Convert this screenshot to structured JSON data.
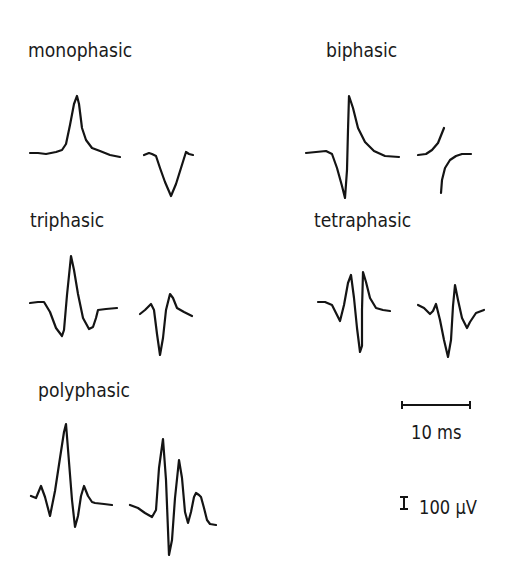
{
  "figure": {
    "labels": {
      "monophasic": "monophasic",
      "biphasic": "biphasic",
      "triphasic": "triphasic",
      "tetraphasic": "tetraphasic",
      "polyphasic": "polyphasic"
    },
    "scale_bars": {
      "time": "10 ms",
      "amplitude": "100 µV"
    },
    "colors": {
      "trace": "#141414",
      "background": "#ffffff"
    },
    "waveforms": [
      {
        "group": "monophasic",
        "index": 1,
        "points": [
          [
            30,
            153
          ],
          [
            38,
            153
          ],
          [
            46,
            154
          ],
          [
            56,
            152
          ],
          [
            62,
            150
          ],
          [
            66,
            144
          ],
          [
            70,
            125
          ],
          [
            74,
            104
          ],
          [
            77,
            96
          ],
          [
            79,
            104
          ],
          [
            82,
            128
          ],
          [
            86,
            140
          ],
          [
            92,
            148
          ],
          [
            100,
            151
          ],
          [
            110,
            155
          ],
          [
            120,
            157
          ]
        ]
      },
      {
        "group": "monophasic",
        "index": 2,
        "points": [
          [
            144,
            155
          ],
          [
            149,
            153
          ],
          [
            152,
            154
          ],
          [
            156,
            156
          ],
          [
            160,
            168
          ],
          [
            165,
            182
          ],
          [
            171,
            196
          ],
          [
            176,
            184
          ],
          [
            181,
            168
          ],
          [
            186,
            152
          ],
          [
            189,
            154
          ],
          [
            193,
            155
          ]
        ]
      },
      {
        "group": "biphasic",
        "index": 1,
        "points": [
          [
            306,
            153
          ],
          [
            316,
            152
          ],
          [
            326,
            151
          ],
          [
            332,
            154
          ],
          [
            337,
            168
          ],
          [
            342,
            186
          ],
          [
            345,
            198
          ],
          [
            347,
            170
          ],
          [
            348,
            130
          ],
          [
            349,
            96
          ],
          [
            353,
            108
          ],
          [
            358,
            128
          ],
          [
            365,
            142
          ],
          [
            374,
            151
          ],
          [
            385,
            156
          ],
          [
            399,
            157
          ]
        ]
      },
      {
        "group": "biphasic",
        "index": 2,
        "points": [
          [
            418,
            155
          ],
          [
            426,
            154
          ],
          [
            432,
            150
          ],
          [
            438,
            143
          ],
          [
            442,
            133
          ],
          [
            444,
            128
          ]
        ]
      },
      {
        "group": "biphasic",
        "index": 3,
        "points": [
          [
            441,
            193
          ],
          [
            442,
            180
          ],
          [
            445,
            168
          ],
          [
            450,
            160
          ],
          [
            456,
            156
          ],
          [
            462,
            154
          ],
          [
            471,
            154
          ]
        ]
      },
      {
        "group": "triphasic",
        "index": 1,
        "points": [
          [
            30,
            303
          ],
          [
            38,
            302
          ],
          [
            44,
            302
          ],
          [
            50,
            312
          ],
          [
            56,
            328
          ],
          [
            62,
            336
          ],
          [
            64,
            330
          ],
          [
            67,
            295
          ],
          [
            71,
            256
          ],
          [
            74,
            270
          ],
          [
            78,
            294
          ],
          [
            83,
            318
          ],
          [
            89,
            329
          ],
          [
            93,
            327
          ],
          [
            96,
            318
          ],
          [
            98,
            310
          ],
          [
            106,
            309
          ],
          [
            117,
            308
          ]
        ]
      },
      {
        "group": "triphasic",
        "index": 2,
        "points": [
          [
            140,
            314
          ],
          [
            145,
            310
          ],
          [
            151,
            304
          ],
          [
            154,
            310
          ],
          [
            157,
            334
          ],
          [
            160,
            355
          ],
          [
            163,
            338
          ],
          [
            166,
            310
          ],
          [
            170,
            294
          ],
          [
            173,
            298
          ],
          [
            177,
            308
          ],
          [
            184,
            312
          ],
          [
            192,
            316
          ]
        ]
      },
      {
        "group": "tetraphasic",
        "index": 1,
        "points": [
          [
            318,
            302
          ],
          [
            325,
            302
          ],
          [
            332,
            305
          ],
          [
            336,
            313
          ],
          [
            340,
            321
          ],
          [
            344,
            305
          ],
          [
            348,
            283
          ],
          [
            351,
            275
          ],
          [
            354,
            298
          ],
          [
            357,
            328
          ],
          [
            360,
            352
          ],
          [
            362,
            346
          ],
          [
            362,
            310
          ],
          [
            363,
            272
          ],
          [
            366,
            282
          ],
          [
            370,
            298
          ],
          [
            376,
            308
          ],
          [
            383,
            310
          ],
          [
            390,
            311
          ]
        ]
      },
      {
        "group": "tetraphasic",
        "index": 2,
        "points": [
          [
            418,
            305
          ],
          [
            424,
            308
          ],
          [
            430,
            314
          ],
          [
            433,
            311
          ],
          [
            436,
            304
          ],
          [
            440,
            320
          ],
          [
            444,
            340
          ],
          [
            448,
            357
          ],
          [
            451,
            340
          ],
          [
            453,
            306
          ],
          [
            455,
            285
          ],
          [
            458,
            300
          ],
          [
            462,
            318
          ],
          [
            467,
            328
          ],
          [
            470,
            322
          ],
          [
            476,
            313
          ],
          [
            484,
            310
          ]
        ]
      },
      {
        "group": "polyphasic",
        "index": 1,
        "points": [
          [
            31,
            496
          ],
          [
            36,
            498
          ],
          [
            41,
            486
          ],
          [
            45,
            497
          ],
          [
            50,
            516
          ],
          [
            55,
            491
          ],
          [
            60,
            458
          ],
          [
            64,
            432
          ],
          [
            66,
            424
          ],
          [
            69,
            462
          ],
          [
            72,
            500
          ],
          [
            75,
            527
          ],
          [
            78,
            516
          ],
          [
            81,
            496
          ],
          [
            84,
            486
          ],
          [
            88,
            496
          ],
          [
            92,
            502
          ],
          [
            95,
            503
          ],
          [
            104,
            504
          ],
          [
            112,
            505
          ]
        ]
      },
      {
        "group": "polyphasic",
        "index": 2,
        "points": [
          [
            130,
            505
          ],
          [
            138,
            508
          ],
          [
            145,
            513
          ],
          [
            152,
            517
          ],
          [
            156,
            510
          ],
          [
            159,
            468
          ],
          [
            163,
            439
          ],
          [
            166,
            480
          ],
          [
            169,
            555
          ],
          [
            172,
            540
          ],
          [
            175,
            498
          ],
          [
            179,
            460
          ],
          [
            182,
            478
          ],
          [
            185,
            512
          ],
          [
            188,
            523
          ],
          [
            191,
            512
          ],
          [
            194,
            497
          ],
          [
            196,
            493
          ],
          [
            199,
            495
          ],
          [
            201,
            497
          ],
          [
            204,
            508
          ],
          [
            207,
            520
          ],
          [
            210,
            524
          ],
          [
            216,
            525
          ]
        ]
      }
    ],
    "scale_bar_geometry": {
      "time_bar": {
        "x1": 402,
        "x2": 470,
        "y": 405
      },
      "amplitude_bar": {
        "x": 404,
        "y1": 497,
        "y2": 509
      }
    }
  }
}
